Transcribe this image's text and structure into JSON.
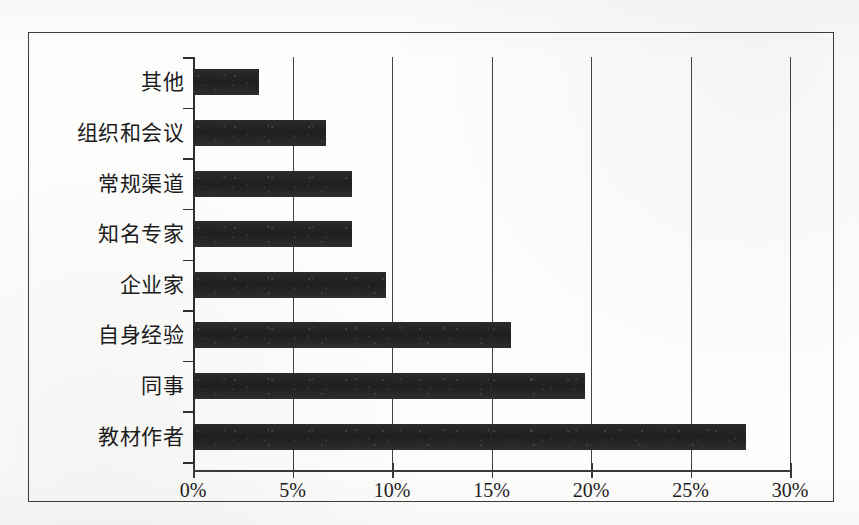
{
  "chart_data": {
    "type": "bar",
    "orientation": "horizontal",
    "title": "",
    "subtitle": "",
    "xlabel": "",
    "ylabel": "",
    "categories": [
      "其他",
      "组织和会议",
      "常规渠道",
      "知名专家",
      "企业家",
      "自身经验",
      "同事",
      "教材作者"
    ],
    "values": [
      3.3,
      6.7,
      8.0,
      8.0,
      9.7,
      16.0,
      19.7,
      27.8
    ],
    "value_unit": "%",
    "xlim": [
      0,
      30
    ],
    "xticks": [
      0,
      5,
      10,
      15,
      20,
      25,
      30
    ],
    "xticklabels": [
      "0%",
      "5%",
      "10%",
      "15%",
      "20%",
      "25%",
      "30%"
    ],
    "grid": "vertical",
    "legend": "none",
    "series": [
      {
        "name": "",
        "values": [
          3.3,
          6.7,
          8.0,
          8.0,
          9.7,
          16.0,
          19.7,
          27.8
        ]
      }
    ],
    "colors": {
      "bar": "#262626",
      "axis": "#2f2f2f",
      "gridline": "#434343",
      "frame": "#3d3d3d",
      "text": "#1c1c1c",
      "background": "#fdfdfc"
    }
  }
}
